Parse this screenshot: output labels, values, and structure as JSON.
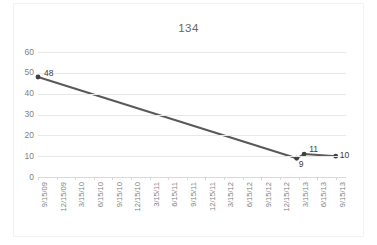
{
  "chart_data": {
    "type": "line",
    "title": "134",
    "xlabel": "",
    "ylabel": "",
    "ylim": [
      0,
      60
    ],
    "ytick_step": 10,
    "yticks": [
      0,
      10,
      20,
      30,
      40,
      50,
      60
    ],
    "grid": true,
    "legend": "none",
    "categories": [
      "9/15/09",
      "12/15/09",
      "3/15/10",
      "6/15/10",
      "9/15/10",
      "12/15/10",
      "3/15/11",
      "6/15/11",
      "9/15/11",
      "12/15/11",
      "3/15/12",
      "6/15/12",
      "9/15/12",
      "12/15/12",
      "3/15/13",
      "6/15/13",
      "9/15/13"
    ],
    "series": [
      {
        "name": "134",
        "color": "#595959",
        "points": [
          {
            "x": "9/15/09",
            "x_index": 0,
            "value": 48,
            "label": "48"
          },
          {
            "x": "12/15/12",
            "x_index": 13.9,
            "value": 9,
            "label": "9"
          },
          {
            "x": "3/15/13",
            "x_index": 14.3,
            "value": 11,
            "label": "11"
          },
          {
            "x": "9/15/13",
            "x_index": 16,
            "value": 10,
            "label": "10"
          }
        ]
      }
    ],
    "colors": {
      "line": "#595959",
      "marker": "#404040",
      "gridline": "#e8e8e8",
      "axis": "#d9d9d9",
      "tick_text": "#7f7f7f",
      "title_text": "#666666",
      "data_label_text": "#404040",
      "plot_background": "#ffffff",
      "frame_border": "#f2f2f2"
    }
  }
}
